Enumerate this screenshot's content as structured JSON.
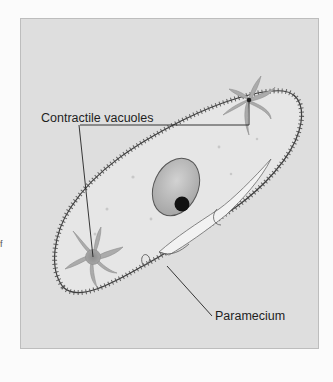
{
  "figure": {
    "labels": {
      "contractile_vacuoles": "Contractile vacuoles",
      "paramecium": "Paramecium"
    },
    "edge_fragment": "f",
    "colors": {
      "page_background": "#fbfbfb",
      "panel_background": "#dedede",
      "cell_body": "#e6e6e6",
      "cilia": "#4a4a4a",
      "macronucleus": "#b3b3b3",
      "micronucleus": "#111111",
      "vacuole_arms": "#a8a8a8",
      "oral_groove": "#f2f2f2",
      "leader_line": "#222222"
    }
  }
}
